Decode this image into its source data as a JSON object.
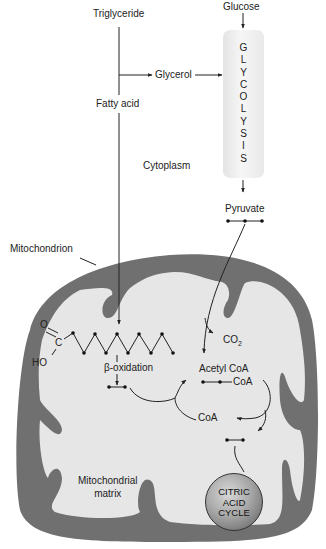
{
  "diagram": {
    "labels": {
      "triglyceride": "Triglyceride",
      "glucose": "Glucose",
      "glycerol": "Glycerol",
      "fatty_acid": "Fatty acid",
      "cytoplasm": "Cytoplasm",
      "pyruvate": "Pyruvate",
      "mitochondrion": "Mitochondrion",
      "co2": "CO",
      "co2_sub": "2",
      "beta_oxidation": "β-oxidation",
      "acetyl_coa": "Acetyl CoA",
      "acetyl_coa_group": "CoA",
      "coa": "CoA",
      "matrix_line1": "Mitochondrial",
      "matrix_line2": "matrix",
      "carboxyl_o": "O",
      "carboxyl_c": "C",
      "carboxyl_ho": "HO"
    },
    "glycolysis": {
      "letters": [
        "G",
        "L",
        "Y",
        "C",
        "O",
        "L",
        "Y",
        "S",
        "I",
        "S"
      ]
    },
    "citric_acid_cycle": {
      "lines": [
        "CITRIC",
        "ACID",
        "CYCLE"
      ]
    },
    "colors": {
      "membrane": "#707070",
      "matrix": "#e6e6e6",
      "lines": "#222222"
    }
  }
}
